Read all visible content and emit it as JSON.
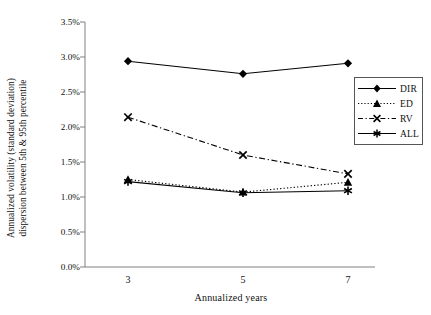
{
  "chart_data": {
    "type": "line",
    "title": "",
    "xlabel": "Annualized years",
    "ylabel": "Annualized volatility (standard deviation) dispersion between 5th & 95th percentile",
    "ylabel_line1": "Annualized volatility (standard deviation)",
    "ylabel_line2": "dispersion between 5th & 95th percentile",
    "categories": [
      "3",
      "5",
      "7"
    ],
    "x": [
      3,
      5,
      7
    ],
    "xtick_labels": [
      "3",
      "5",
      "7"
    ],
    "ytick_labels": [
      "0.0%",
      "0.5%",
      "1.0%",
      "1.5%",
      "2.0%",
      "2.5%",
      "3.0%",
      "3.5%"
    ],
    "ytick_values": [
      0.0,
      0.5,
      1.0,
      1.5,
      2.0,
      2.5,
      3.0,
      3.5
    ],
    "ylim": [
      0.0,
      3.5
    ],
    "grid": false,
    "legend_position": "right",
    "units": "percent",
    "series": [
      {
        "name": "DIR",
        "values": [
          2.94,
          2.76,
          2.91
        ],
        "marker": "diamond",
        "dash": "solid",
        "color": "#000000"
      },
      {
        "name": "ED",
        "values": [
          1.25,
          1.07,
          1.21
        ],
        "marker": "triangle",
        "dash": "dotted",
        "color": "#000000"
      },
      {
        "name": "RV",
        "values": [
          2.14,
          1.6,
          1.33
        ],
        "marker": "cross",
        "dash": "dashdot",
        "color": "#000000"
      },
      {
        "name": "ALL",
        "values": [
          1.22,
          1.06,
          1.09
        ],
        "marker": "asterisk",
        "dash": "solid",
        "color": "#000000"
      }
    ]
  },
  "legend": {
    "items": [
      {
        "label": "DIR"
      },
      {
        "label": "ED"
      },
      {
        "label": "RV"
      },
      {
        "label": "ALL"
      }
    ]
  },
  "axes": {
    "x_title": "Annualized years",
    "y_title_line1": "Annualized volatility (standard deviation)",
    "y_title_line2": "dispersion between 5th & 95th percentile"
  },
  "colors": {
    "line": "#000000",
    "axis": "#808080",
    "text": "#111111",
    "background": "#ffffff"
  }
}
